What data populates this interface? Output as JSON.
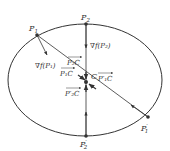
{
  "diagram": {
    "title": "",
    "colors": {
      "stroke": "#333333",
      "background": "#ffffff"
    },
    "ellipse": {
      "cx": 85,
      "cy": 80,
      "rx": 77,
      "ry": 56
    },
    "center": {
      "label": "C",
      "x": 87,
      "y": 82
    },
    "points": [
      {
        "id": "P1",
        "label": "P",
        "sub": "1",
        "prime": "",
        "x": 37,
        "y": 35,
        "label_x": 29,
        "label_y": 30
      },
      {
        "id": "P2",
        "label": "P",
        "sub": "2",
        "prime": "",
        "x": 86,
        "y": 24,
        "label_x": 82,
        "label_y": 20
      },
      {
        "id": "P1p",
        "label": "P",
        "sub": "1",
        "prime": "′",
        "x": 148,
        "y": 117,
        "label_x": 142,
        "label_y": 131
      },
      {
        "id": "P2p",
        "label": "P",
        "sub": "2",
        "prime": "′",
        "x": 86,
        "y": 136,
        "label_x": 81,
        "label_y": 148
      }
    ],
    "labels": {
      "grad_p1": "∇f(P₁)",
      "grad_p2": "∇f(P₂)",
      "grad_p1p": "∇f(P′₁)",
      "grad_p2p": "∇f(P′₂)",
      "vec_p2c": "P₂C",
      "vec_p1c": "P₁C",
      "vec_p2pc": "P′₂C",
      "vec_p1pc": "P′₁C"
    }
  }
}
